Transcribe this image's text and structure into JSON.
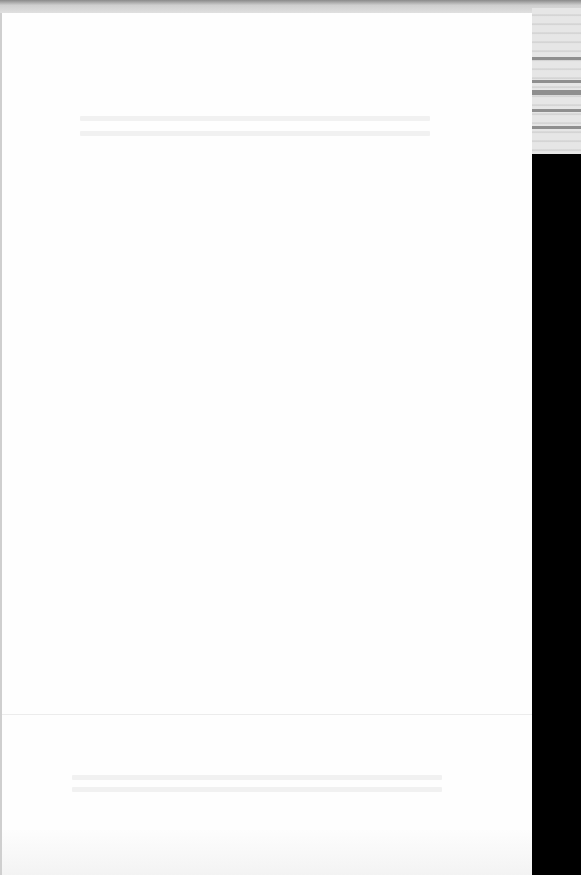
{
  "document": {
    "legibility": "text not legible (faded scan)",
    "blocks": [
      {
        "id": "heading-line-1",
        "text": ""
      },
      {
        "id": "heading-line-2",
        "text": ""
      },
      {
        "id": "footer-line-1",
        "text": ""
      },
      {
        "id": "footer-line-2",
        "text": ""
      }
    ]
  },
  "colors": {
    "page": "#fefefe",
    "frame": "#000000",
    "scanner_strip": "#e6e6e6"
  }
}
